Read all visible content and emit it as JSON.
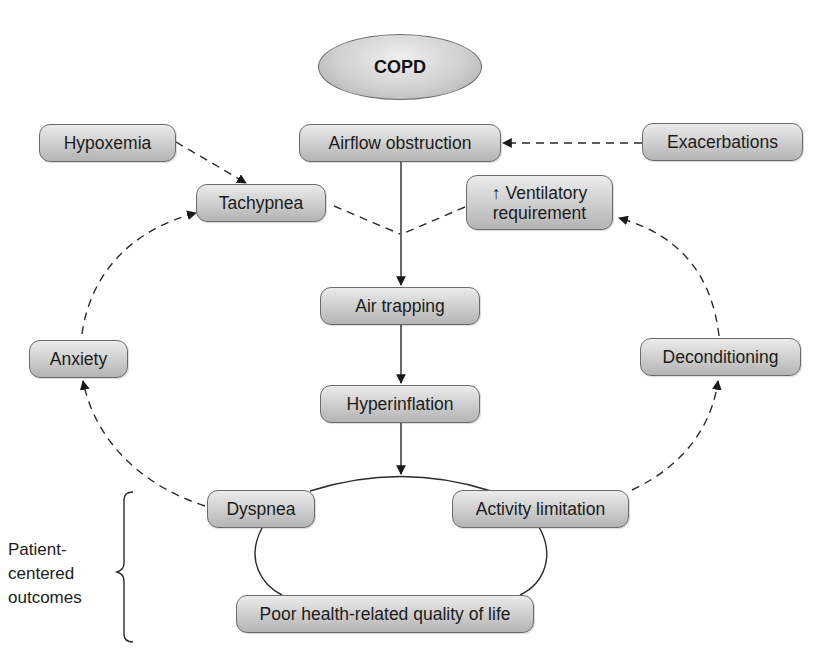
{
  "diagram": {
    "root": {
      "label": "COPD"
    },
    "nodes": {
      "airflow_obstruction": "Airflow obstruction",
      "exacerbations": "Exacerbations",
      "hypoxemia": "Hypoxemia",
      "tachypnea": "Tachypnea",
      "ventilatory_requirement_line1": "↑ Ventilatory",
      "ventilatory_requirement_line2": "requirement",
      "air_trapping": "Air trapping",
      "hyperinflation": "Hyperinflation",
      "anxiety": "Anxiety",
      "deconditioning": "Deconditioning",
      "dyspnea": "Dyspnea",
      "activity_limitation": "Activity limitation",
      "poor_hrqol": "Poor health-related quality of life"
    },
    "bracket_label": {
      "line1": "Patient-",
      "line2": "centered",
      "line3": "outcomes"
    },
    "edges": [
      {
        "from": "COPD",
        "to": "Airflow obstruction",
        "style": "none"
      },
      {
        "from": "Exacerbations",
        "to": "Airflow obstruction",
        "style": "dashed"
      },
      {
        "from": "Hypoxemia",
        "to": "Tachypnea",
        "style": "dashed"
      },
      {
        "from": "Airflow obstruction",
        "to": "Air trapping",
        "style": "solid"
      },
      {
        "from": "Tachypnea",
        "to": "Air trapping",
        "style": "dashed"
      },
      {
        "from": "↑ Ventilatory requirement",
        "to": "Air trapping",
        "style": "dashed"
      },
      {
        "from": "Air trapping",
        "to": "Hyperinflation",
        "style": "solid"
      },
      {
        "from": "Hyperinflation",
        "to": "Dyspnea / Activity limitation",
        "style": "solid"
      },
      {
        "from": "Dyspnea",
        "to": "Anxiety",
        "style": "dashed"
      },
      {
        "from": "Anxiety",
        "to": "Tachypnea",
        "style": "dashed"
      },
      {
        "from": "Activity limitation",
        "to": "Deconditioning",
        "style": "dashed"
      },
      {
        "from": "Deconditioning",
        "to": "↑ Ventilatory requirement",
        "style": "dashed"
      },
      {
        "from": "Dyspnea",
        "to": "Poor health-related quality of life",
        "style": "solid-curve"
      },
      {
        "from": "Activity limitation",
        "to": "Poor health-related quality of life",
        "style": "solid-curve"
      }
    ],
    "colors": {
      "node_fill_top": "#ececec",
      "node_fill_bottom": "#b4b4b4",
      "node_border": "#6b6b6b",
      "line": "#2a2a2a"
    }
  }
}
